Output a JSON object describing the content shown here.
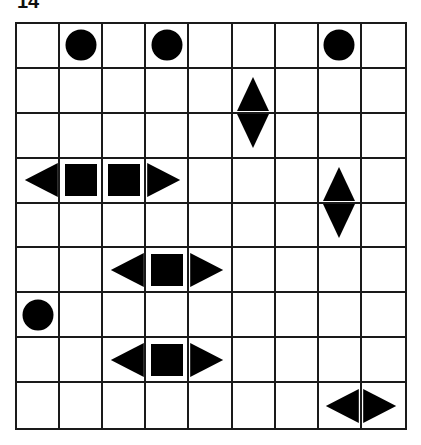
{
  "puzzle": {
    "label": "14",
    "rows": 9,
    "cols": 9,
    "grid": [
      [
        "",
        "circle",
        "",
        "circle",
        "",
        "",
        "",
        "circle",
        ""
      ],
      [
        "",
        "",
        "",
        "",
        "",
        "up",
        "",
        "",
        ""
      ],
      [
        "",
        "",
        "",
        "",
        "",
        "down",
        "",
        "",
        ""
      ],
      [
        "left",
        "square",
        "square",
        "right",
        "",
        "",
        "",
        "up",
        ""
      ],
      [
        "",
        "",
        "",
        "",
        "",
        "",
        "",
        "down",
        ""
      ],
      [
        "",
        "",
        "left",
        "square",
        "right",
        "",
        "",
        "",
        ""
      ],
      [
        "circle",
        "",
        "",
        "",
        "",
        "",
        "",
        "",
        ""
      ],
      [
        "",
        "",
        "left",
        "square",
        "right",
        "",
        "",
        "",
        ""
      ],
      [
        "",
        "",
        "",
        "",
        "",
        "",
        "",
        "left",
        "right"
      ]
    ]
  }
}
